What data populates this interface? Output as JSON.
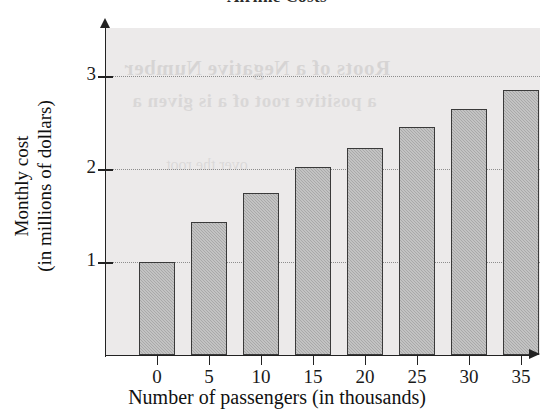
{
  "chart_data": {
    "type": "bar",
    "title": "Airline Costs",
    "xlabel": "Number of passengers (in thousands)",
    "ylabel": "Monthly cost (in millions of dollars)",
    "ylabel_line1": "Monthly cost",
    "ylabel_line2": "(in millions of dollars)",
    "categories": [
      "0",
      "5",
      "10",
      "15",
      "20",
      "25",
      "30",
      "35"
    ],
    "values": [
      1.0,
      1.43,
      1.74,
      2.02,
      2.23,
      2.45,
      2.65,
      2.85
    ],
    "x_tick_labels": [
      "0",
      "5",
      "10",
      "15",
      "20",
      "25",
      "30",
      "35"
    ],
    "y_tick_labels": [
      "1",
      "2",
      "3"
    ],
    "y_tick_values": [
      1,
      2,
      3
    ],
    "ylim": [
      0,
      3.55
    ],
    "xlim_categories": 8,
    "grid": "horizontal-dotted",
    "legend": "none",
    "series_name": "Monthly cost",
    "bar_fill_color": "#a9a9a9",
    "bar_border_color": "#3a3a3a",
    "panel_background_color": "#eceaea",
    "axis_color": "#222222",
    "gridline_color": "#8d8d8d"
  },
  "bleed_through_text": {
    "line1": "Roots of a Negative Number",
    "line2": "a positive root of a is given a",
    "line3": "over the root"
  },
  "icons": {
    "y_axis_arrow": "arrow-up-icon",
    "x_axis_arrow": "arrow-right-icon"
  }
}
